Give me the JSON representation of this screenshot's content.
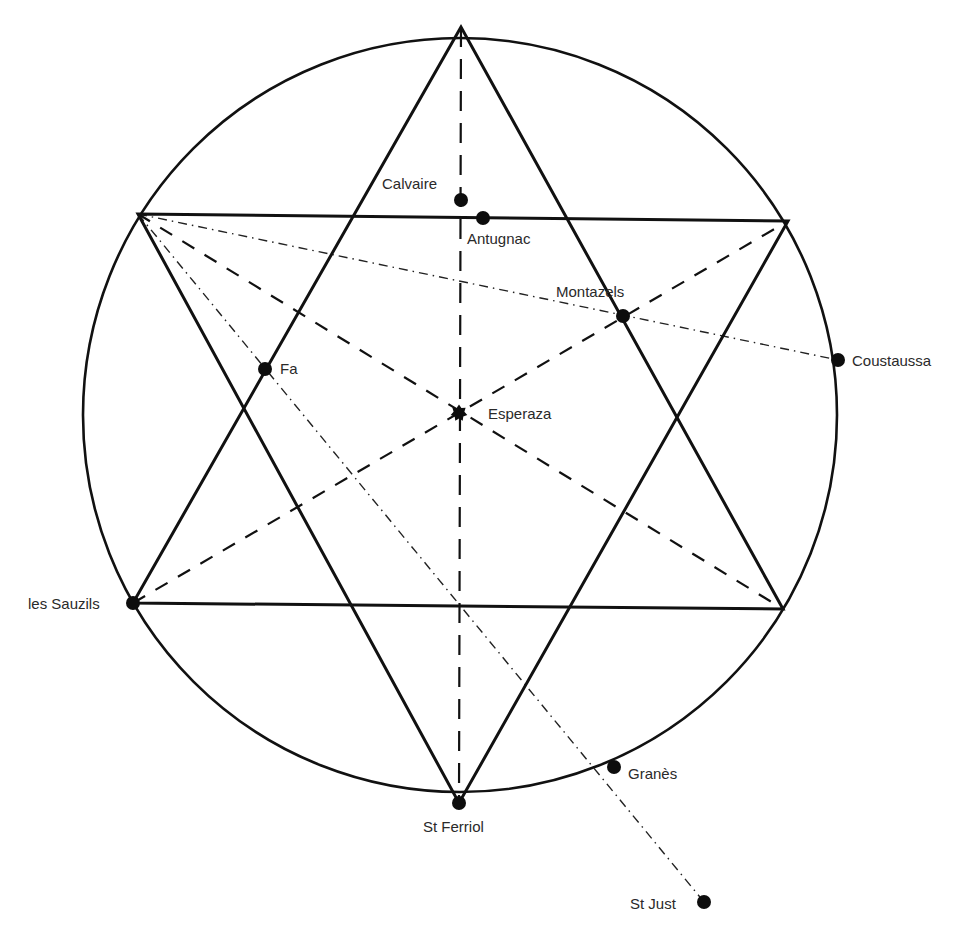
{
  "diagram": {
    "type": "geometric-map-overlay",
    "circle": {
      "cx": 460,
      "cy": 415,
      "r": 377
    },
    "star_vertices": {
      "top": [
        461,
        27
      ],
      "upper_left": [
        138,
        214
      ],
      "upper_right": [
        788,
        221
      ],
      "lower_left": [
        133,
        603
      ],
      "lower_right": [
        783,
        609
      ],
      "bottom": [
        459,
        803
      ]
    },
    "places": [
      {
        "id": "calvaire",
        "name": "Calvaire",
        "x": 461,
        "y": 200,
        "label_x": 382,
        "label_y": 189,
        "anchor": "start"
      },
      {
        "id": "antugnac",
        "name": "Antugnac",
        "x": 483,
        "y": 218,
        "label_x": 467,
        "label_y": 244,
        "anchor": "start"
      },
      {
        "id": "montazels",
        "name": "Montazels",
        "x": 623,
        "y": 316,
        "label_x": 556,
        "label_y": 297,
        "anchor": "start"
      },
      {
        "id": "coustaussa",
        "name": "Coustaussa",
        "x": 838,
        "y": 360,
        "label_x": 852,
        "label_y": 366,
        "anchor": "start"
      },
      {
        "id": "fa",
        "name": "Fa",
        "x": 265,
        "y": 369,
        "label_x": 280,
        "label_y": 374,
        "anchor": "start"
      },
      {
        "id": "esperaza",
        "name": "Esperaza",
        "x": 459,
        "y": 413,
        "label_x": 488,
        "label_y": 419,
        "anchor": "start"
      },
      {
        "id": "les-sauzils",
        "name": "les Sauzils",
        "x": 133,
        "y": 603,
        "label_x": 28,
        "label_y": 609,
        "anchor": "start"
      },
      {
        "id": "granes",
        "name": "Granès",
        "x": 614,
        "y": 767,
        "label_x": 628,
        "label_y": 779,
        "anchor": "start"
      },
      {
        "id": "st-ferriol",
        "name": "St Ferriol",
        "x": 459,
        "y": 803,
        "label_x": 423,
        "label_y": 832,
        "anchor": "start"
      },
      {
        "id": "st-just",
        "name": "St Just",
        "x": 704,
        "y": 902,
        "label_x": 630,
        "label_y": 909,
        "anchor": "start"
      }
    ],
    "lines": {
      "solid_triangles": [
        {
          "name": "upward-triangle",
          "points": [
            [
              461,
              27
            ],
            [
              133,
              603
            ],
            [
              783,
              609
            ]
          ]
        },
        {
          "name": "downward-triangle",
          "points": [
            [
              138,
              214
            ],
            [
              788,
              221
            ],
            [
              459,
              803
            ]
          ]
        }
      ],
      "dashed": [
        {
          "name": "diagonal-ul-lr",
          "from": [
            138,
            214
          ],
          "to": [
            783,
            609
          ]
        },
        {
          "name": "diagonal-ll-ur",
          "from": [
            133,
            603
          ],
          "to": [
            788,
            221
          ]
        }
      ],
      "vertical_dashed": {
        "name": "vertical-axis",
        "from": [
          461,
          27
        ],
        "to": [
          459,
          803
        ]
      },
      "dash_dot": [
        {
          "name": "alignment-sauzils-coustaussa",
          "from": [
            138,
            214
          ],
          "to": [
            838,
            360
          ]
        },
        {
          "name": "alignment-stjust",
          "from": [
            138,
            214
          ],
          "to": [
            704,
            902
          ]
        }
      ]
    }
  }
}
